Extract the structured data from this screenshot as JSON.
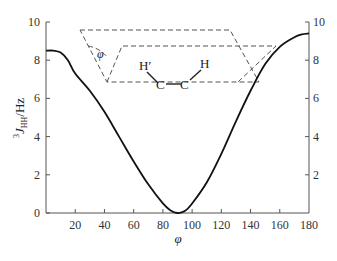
{
  "chart_data": {
    "type": "line",
    "title": "",
    "xlabel": "φ",
    "ylabel": "³J_HH/Hz",
    "ylabel_parts": {
      "sup": "3",
      "main": "J",
      "sub": "HH",
      "unit": "/Hz"
    },
    "xlim": [
      0,
      180
    ],
    "ylim": [
      0,
      10
    ],
    "x_ticks": [
      20,
      40,
      60,
      80,
      100,
      120,
      140,
      160,
      180
    ],
    "y_ticks_left": [
      0,
      2,
      4,
      6,
      8,
      10
    ],
    "y_ticks_right": [
      2,
      4,
      6,
      8,
      10
    ],
    "grid": false,
    "legend": null,
    "series": [
      {
        "name": "Karplus curve",
        "x": [
          0,
          5,
          10,
          15,
          20,
          30,
          40,
          50,
          60,
          70,
          80,
          85,
          90,
          95,
          100,
          110,
          120,
          130,
          140,
          150,
          160,
          170,
          175,
          180
        ],
        "values": [
          8.5,
          8.5,
          8.4,
          8.0,
          7.3,
          6.4,
          5.3,
          4.0,
          2.7,
          1.5,
          0.5,
          0.15,
          0.0,
          0.1,
          0.5,
          1.6,
          3.1,
          4.8,
          6.4,
          7.8,
          8.7,
          9.2,
          9.35,
          9.4
        ]
      }
    ],
    "annotations": {
      "inset": "Newman-type dihedral diagram of H'–C–C–H with two dashed planes",
      "angle_label": "φ",
      "atoms": [
        "H′",
        "C",
        "C",
        "H"
      ]
    }
  }
}
